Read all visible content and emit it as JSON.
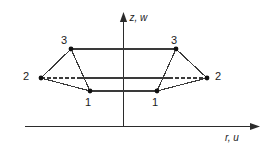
{
  "figure": {
    "background_color": "#ffffff",
    "line_color": "#3a3a3a",
    "axis_color": "#2b2b2b",
    "node_color": "#111111",
    "axes": {
      "vertical": {
        "label": "z, w",
        "name": "z-w-axis",
        "x": 123.5,
        "y_top": 14,
        "y_bottom": 127,
        "arrow": "up"
      },
      "horizontal": {
        "label": "r, u",
        "name": "r-u-axis",
        "y": 126.5,
        "x_left": 25,
        "x_right": 258,
        "arrow": "right"
      }
    },
    "nodes": [
      {
        "id": "left-3",
        "label": "3",
        "x": 71,
        "y": 49,
        "label_x": 61,
        "label_y": 35
      },
      {
        "id": "left-2",
        "label": "2",
        "x": 41,
        "y": 78,
        "label_x": 23,
        "label_y": 71
      },
      {
        "id": "left-1",
        "label": "1",
        "x": 90,
        "y": 91,
        "label_x": 85,
        "label_y": 97
      },
      {
        "id": "right-3",
        "label": "3",
        "x": 176,
        "y": 49,
        "label_x": 171,
        "label_y": 35
      },
      {
        "id": "right-2",
        "label": "2",
        "x": 207,
        "y": 78,
        "label_x": 215,
        "label_y": 71
      },
      {
        "id": "right-1",
        "label": "1",
        "x": 157,
        "y": 91,
        "label_x": 152,
        "label_y": 97
      }
    ],
    "element_edges": [
      {
        "name": "left-edge-3-2",
        "x1": 71,
        "y1": 49,
        "x2": 41,
        "y2": 78,
        "style": "solid"
      },
      {
        "name": "left-edge-3-1",
        "x1": 71,
        "y1": 49,
        "x2": 90,
        "y2": 91,
        "style": "solid"
      },
      {
        "name": "left-edge-2-1",
        "x1": 41,
        "y1": 78,
        "x2": 90,
        "y2": 91,
        "style": "solid"
      },
      {
        "name": "right-edge-3-2",
        "x1": 176,
        "y1": 49,
        "x2": 207,
        "y2": 78,
        "style": "solid"
      },
      {
        "name": "right-edge-3-1",
        "x1": 176,
        "y1": 49,
        "x2": 157,
        "y2": 91,
        "style": "solid"
      },
      {
        "name": "right-edge-2-1",
        "x1": 207,
        "y1": 78,
        "x2": 157,
        "y2": 91,
        "style": "solid"
      }
    ],
    "connector_lines": [
      {
        "name": "connector-level-3",
        "x1": 71,
        "y1": 49,
        "x2": 176,
        "y2": 49,
        "style": "solid"
      },
      {
        "name": "connector-level-1",
        "x1": 90,
        "y1": 91,
        "x2": 157,
        "y2": 91,
        "style": "solid"
      },
      {
        "name": "connector-level-2-left-dashed",
        "x1": 41,
        "y1": 78,
        "x2": 79,
        "y2": 78,
        "style": "dashed"
      },
      {
        "name": "connector-level-2-middle-solid",
        "x1": 79,
        "y1": 78,
        "x2": 169,
        "y2": 78,
        "style": "solid"
      },
      {
        "name": "connector-level-2-right-dashed",
        "x1": 169,
        "y1": 78,
        "x2": 207,
        "y2": 78,
        "style": "dashed"
      }
    ]
  }
}
